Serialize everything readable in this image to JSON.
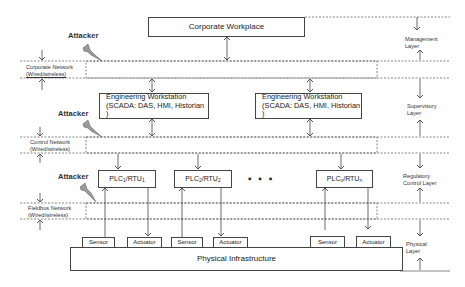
{
  "diagram": {
    "corporate_workplace": "Corporate Workplace",
    "workstations": [
      {
        "line1": "Engineering Workstation",
        "line2": "(SCADA: DAS, HMI, Historian )"
      },
      {
        "line1": "Engineering Workstation",
        "line2": "(SCADA: DAS, HMI, Historian )"
      }
    ],
    "plcs": [
      {
        "label": "PLC",
        "sub1": "1",
        "mid": "/RTU",
        "sub2": "1"
      },
      {
        "label": "PLC",
        "sub1": "2",
        "mid": "/RTU",
        "sub2": "2"
      },
      {
        "label": "PLC",
        "sub1": "n",
        "mid": "/RTU",
        "sub2": "n"
      }
    ],
    "ellipsis": "▪  ▪  ▪",
    "devices": {
      "sensor": "Sensor",
      "actuator": "Actuator"
    },
    "physical_infrastructure": "Physical Infrastructure",
    "attacker_label": "Attacker",
    "attacker_icon": "lightning-bolt-icon",
    "networks": [
      {
        "line1": "Corporate Network",
        "line2": "(Wired/wireless)"
      },
      {
        "line1": "Control Network",
        "line2": "(Wired/wireless)"
      },
      {
        "line1": "Fieldbus Network",
        "line2": "(Wired/wireless)"
      }
    ],
    "layers": [
      {
        "line1": "Management",
        "line2": "Layer"
      },
      {
        "line1": "Supervisory",
        "line2": "Layer"
      },
      {
        "line1": "Regulatory",
        "line2": "Control Layer"
      },
      {
        "line1": "Physical",
        "line2": "Layer"
      }
    ]
  }
}
